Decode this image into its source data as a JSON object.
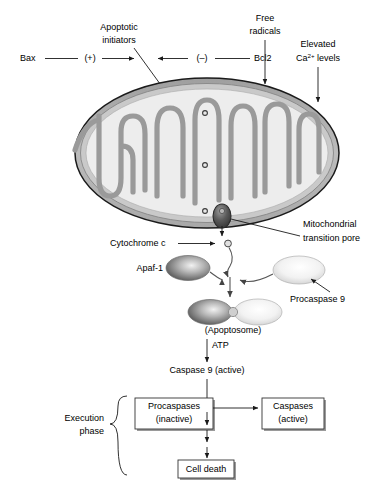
{
  "diagram": {
    "colors": {
      "outline": "#1a1a1a",
      "outer_membrane": "#b5b5b5",
      "intermembrane": "#c9c9c9",
      "matrix": "#ededed",
      "cristae": "#9a9a9a",
      "line": "#333333",
      "dark_protein": "#6e6e6e",
      "light_protein": "#e2e2e2",
      "pore": "#4a4a4a",
      "background": "#ffffff"
    }
  },
  "regulators": {
    "activator_label": "Bax",
    "activator_sign": "(+)",
    "inhibitor_sign": "(–)",
    "inhibitor_label": "Bcl2",
    "target_label_line1": "Apoptotic",
    "target_label_line2": "initiators"
  },
  "stressors": [
    {
      "id": "free-radicals",
      "line1": "Free",
      "line2": "radicals"
    },
    {
      "id": "elevated-calcium",
      "line1": "Elevated",
      "line2_prefix": "Ca",
      "line2_superscript": "2+",
      "line2_suffix": " levels"
    }
  ],
  "organelle": {
    "name": "mitochondrion",
    "pore_label_line1": "Mitochondrial",
    "pore_label_line2": "transition pore",
    "internal_marker_count": 3
  },
  "release": {
    "cytochrome_c_label": "Cytochrome c"
  },
  "complex": {
    "apaf1_label": "Apaf-1",
    "procaspase9_label": "Procaspase 9",
    "apoptosome_label": "(Apoptosome)"
  },
  "activation": {
    "atp_label": "ATP",
    "caspase9_label": "Caspase 9 (active)"
  },
  "execution": {
    "phase_label_line1": "Execution",
    "phase_label_line2": "phase",
    "procaspases_line1": "Procaspases",
    "procaspases_line2": "(inactive)",
    "caspases_line1": "Caspases",
    "caspases_line2": "(active)",
    "cell_death_label": "Cell death"
  }
}
